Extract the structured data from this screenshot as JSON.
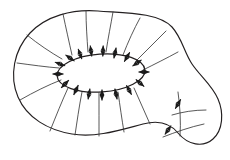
{
  "figure": {
    "background_color": "#ffffff",
    "width": 230,
    "height": 160,
    "stroke_color": "#231f20",
    "field_line_color": "#3a3a3a",
    "arrow_color": "#1a1a1a"
  },
  "outer_boundary": {
    "name": "blob-region-outline",
    "path": "M 98 11 C 72 9, 46 16, 30 33 C 14 50, 9 76, 18 97 C 27 118, 48 130, 72 134 C 96 138, 120 130, 143 124 C 158 120, 170 123, 178 133 C 188 145, 203 148, 213 139 C 223 130, 224 113, 218 99 C 212 85, 200 76, 192 64 C 184 52, 182 38, 172 27 C 158 12, 124 13, 98 11 Z"
  },
  "inner_ellipse": {
    "name": "inner-loop",
    "cx": 101,
    "cy": 73,
    "rx": 44,
    "ry": 19,
    "rotation": -4
  },
  "field_lines": [
    {
      "d": "M 62 59 C 50 52, 38 44, 27 35"
    },
    {
      "d": "M 59 68 C 46 67, 32 65, 17 63"
    },
    {
      "d": "M 61 80 C 48 85, 34 92, 20 100"
    },
    {
      "d": "M 68 88 C 62 101, 56 116, 50 131"
    },
    {
      "d": "M 82 92 C 79 107, 77 122, 75 135"
    },
    {
      "d": "M 99 93 C 99 108, 99 123, 99 136"
    },
    {
      "d": "M 118 92 C 120 106, 122 120, 124 132"
    },
    {
      "d": "M 134 88 C 139 100, 145 112, 150 124"
    },
    {
      "d": "M 72 55 C 69 42, 66 28, 63 14"
    },
    {
      "d": "M 88 52 C 87 38, 86 24, 86 11"
    },
    {
      "d": "M 106 52 C 108 38, 111 24, 113 12"
    },
    {
      "d": "M 123 55 C 128 42, 134 29, 140 18"
    },
    {
      "d": "M 136 61 C 146 51, 156 41, 166 31"
    },
    {
      "d": "M 143 70 C 155 64, 167 58, 178 52"
    }
  ],
  "cross_curves": [
    {
      "d": "M 172 115 C 182 112, 194 110, 206 110"
    },
    {
      "d": "M 163 137 C 176 132, 190 127, 204 124"
    },
    {
      "d": "M 178 92 C 180 106, 181 122, 180 136"
    }
  ],
  "normal_arrows": [
    {
      "x": 70,
      "y": 58,
      "angle": 215
    },
    {
      "x": 80,
      "y": 54,
      "angle": 250
    },
    {
      "x": 91,
      "y": 51,
      "angle": 262
    },
    {
      "x": 103,
      "y": 51,
      "angle": 272
    },
    {
      "x": 115,
      "y": 53,
      "angle": 282
    },
    {
      "x": 127,
      "y": 57,
      "angle": 300
    },
    {
      "x": 137,
      "y": 63,
      "angle": 325
    },
    {
      "x": 144,
      "y": 72,
      "angle": 0
    },
    {
      "x": 140,
      "y": 83,
      "angle": 40
    },
    {
      "x": 129,
      "y": 90,
      "angle": 62
    },
    {
      "x": 116,
      "y": 94,
      "angle": 78
    },
    {
      "x": 102,
      "y": 95,
      "angle": 90
    },
    {
      "x": 89,
      "y": 94,
      "angle": 100
    },
    {
      "x": 76,
      "y": 90,
      "angle": 115
    },
    {
      "x": 65,
      "y": 84,
      "angle": 135
    },
    {
      "x": 58,
      "y": 74,
      "angle": 180
    },
    {
      "x": 60,
      "y": 64,
      "angle": 200
    }
  ],
  "edge_arrows": [
    {
      "x": 178,
      "y": 104,
      "angle": 300
    },
    {
      "x": 168,
      "y": 130,
      "angle": 305
    }
  ],
  "legend": {
    "arrow_style": "double-headed",
    "arrow_length": 11,
    "arrow_head_size": 3.2
  }
}
